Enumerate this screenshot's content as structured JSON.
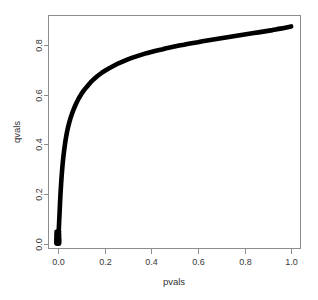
{
  "chart_data": {
    "type": "scatter",
    "title": "",
    "xlabel": "pvals",
    "ylabel": "qvals",
    "xlim": [
      -0.04,
      1.04
    ],
    "ylim": [
      -0.02,
      0.92
    ],
    "grid": false,
    "legend": null,
    "xticks": [
      "0.0",
      "0.2",
      "0.4",
      "0.6",
      "0.8",
      "1.0"
    ],
    "xtick_values": [
      0.0,
      0.2,
      0.4,
      0.6,
      0.8,
      1.0
    ],
    "yticks": [
      "0.0",
      "0.2",
      "0.4",
      "0.6",
      "0.8"
    ],
    "ytick_values": [
      0.0,
      0.2,
      0.4,
      0.6,
      0.8
    ],
    "marker": "filled-circle",
    "marker_color": "#000000",
    "series_name": "qvals",
    "x": [
      0.0,
      0.001,
      0.002,
      0.003,
      0.004,
      0.005,
      0.006,
      0.007,
      0.008,
      0.009,
      0.01,
      0.012,
      0.014,
      0.016,
      0.018,
      0.02,
      0.024,
      0.028,
      0.032,
      0.036,
      0.04,
      0.045,
      0.05,
      0.055,
      0.06,
      0.07,
      0.08,
      0.09,
      0.1,
      0.11,
      0.12,
      0.13,
      0.14,
      0.15,
      0.16,
      0.17,
      0.18,
      0.19,
      0.2,
      0.22,
      0.24,
      0.25,
      0.26,
      0.28,
      0.3,
      0.32,
      0.34,
      0.36,
      0.38,
      0.4,
      0.42,
      0.44,
      0.45,
      0.46,
      0.48,
      0.5,
      0.52,
      0.54,
      0.56,
      0.58,
      0.6,
      0.62,
      0.64,
      0.66,
      0.68,
      0.7,
      0.72,
      0.74,
      0.76,
      0.78,
      0.8,
      0.82,
      0.84,
      0.86,
      0.88,
      0.9,
      0.92,
      0.94,
      0.96,
      0.98,
      1.0
    ],
    "y": [
      0.005,
      0.01,
      0.02,
      0.035,
      0.055,
      0.075,
      0.095,
      0.115,
      0.135,
      0.155,
      0.175,
      0.21,
      0.24,
      0.268,
      0.292,
      0.315,
      0.352,
      0.383,
      0.41,
      0.433,
      0.453,
      0.474,
      0.492,
      0.508,
      0.522,
      0.547,
      0.568,
      0.586,
      0.602,
      0.616,
      0.628,
      0.639,
      0.65,
      0.659,
      0.668,
      0.676,
      0.683,
      0.69,
      0.696,
      0.707,
      0.717,
      0.722,
      0.727,
      0.735,
      0.743,
      0.75,
      0.756,
      0.762,
      0.768,
      0.773,
      0.778,
      0.782,
      0.784,
      0.787,
      0.791,
      0.795,
      0.799,
      0.802,
      0.806,
      0.809,
      0.812,
      0.816,
      0.819,
      0.822,
      0.825,
      0.828,
      0.831,
      0.834,
      0.837,
      0.84,
      0.843,
      0.846,
      0.849,
      0.852,
      0.855,
      0.858,
      0.861,
      0.865,
      0.868,
      0.872,
      0.876
    ],
    "cluster_note": "dense overplotted points near pvals = 0 spanning qvals 0.00 to 0.05"
  }
}
